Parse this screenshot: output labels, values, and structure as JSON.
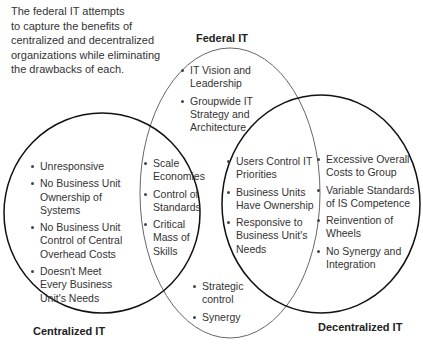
{
  "caption": [
    "The federal IT attempts",
    "to capture the benefits of",
    "centralized and decentralized",
    "organizations while eliminating",
    "the drawbacks of each."
  ],
  "titles": {
    "federal": "Federal IT",
    "centralized": "Centralized IT",
    "decentralized": "Decentralized IT"
  },
  "regions": {
    "federal_only": [
      "IT Vision and Leadership",
      "Groupwide IT Strategy and Architecture"
    ],
    "centralized_only": [
      "Unresponsive",
      "No Business Unit Ownership of Systems",
      "No Business Unit Control of Central Overhead Costs",
      "Doesn't Meet Every Business Unit's Needs"
    ],
    "centralized_federal": [
      "Scale Economies",
      "Control of Standards",
      "Critical Mass of Skills"
    ],
    "decentralized_federal": [
      "Users Control IT Priorities",
      "Business Units Have Ownership",
      "Responsive to Business Unit's Needs"
    ],
    "decentralized_only": [
      "Excessive Overall Costs to Group",
      "Variable Standards of IS Competence",
      "Reinvention of Wheels",
      "No Synergy and Integration"
    ],
    "federal_bottom": [
      "Strategic control",
      "Synergy"
    ]
  },
  "colors": {
    "federal_stroke": "#555555",
    "side_stroke": "#111111"
  }
}
